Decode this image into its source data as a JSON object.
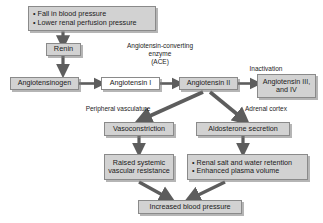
{
  "diagram": {
    "colors": {
      "node_fill": "#d2d2d2",
      "node_border": "#8a8a8a",
      "arrow": "#5d5d5d",
      "text": "#1b1b1b",
      "background": "#ffffff"
    },
    "nodes": {
      "trigger": {
        "line1": "• Fall in blood pressure",
        "line2": "• Lower renal perfusion pressure"
      },
      "renin": {
        "label": "Renin"
      },
      "angiotensinogen": {
        "label": "Angiotensinogen"
      },
      "angiotensin_i": {
        "label": "Angiotensin I"
      },
      "angiotensin_ii": {
        "label": "Angiotensin II"
      },
      "angiotensin_iii_iv": {
        "line1": "Angiotensin III,",
        "line2": "and IV"
      },
      "vasoconstriction": {
        "label": "Vasoconstriction"
      },
      "aldosterone": {
        "label": "Aldosterone secretion"
      },
      "raised_svr": {
        "line1": "Raised systemic",
        "line2": "vascular resistance"
      },
      "renal_effects": {
        "line1": "• Renal salt and water retention",
        "line2": "• Enhanced plasma volume"
      },
      "increased_bp": {
        "label": "Increased blood pressure"
      }
    },
    "edge_labels": {
      "ace": {
        "line1": "Angiotensin-converting",
        "line2": "enzyme",
        "line3": "(ACE)"
      },
      "inactivation": {
        "label": "Inactivation"
      },
      "peripheral_vasculature": {
        "label": "Peripheral vasculature"
      },
      "adrenal_cortex": {
        "label": "Adrenal cortex"
      }
    }
  }
}
